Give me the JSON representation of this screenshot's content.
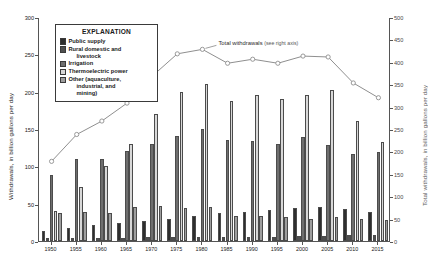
{
  "chart_data": {
    "type": "bar",
    "title": "",
    "subtitle": "",
    "xlabel": "",
    "ylabel": "Withdrawals, in billion gallons per day",
    "y2label": "Total withdrawals, in billion gallons per day",
    "ylim": [
      0,
      300
    ],
    "y2lim": [
      0,
      500
    ],
    "yticks": [
      0,
      50,
      100,
      150,
      200,
      250,
      300
    ],
    "y2ticks": [
      0,
      50,
      100,
      150,
      200,
      250,
      300,
      350,
      400,
      450,
      500
    ],
    "grid": false,
    "legend_position": "inside-top-left",
    "legend_title": "EXPLANATION",
    "categories": [
      "1950",
      "1955",
      "1960",
      "1965",
      "1970",
      "1975",
      "1980",
      "1985",
      "1990",
      "1995",
      "2000",
      "2005",
      "2010",
      "2015"
    ],
    "series": [
      {
        "name": "Public supply",
        "color": "#2e2e2e",
        "values": [
          14,
          17,
          21,
          24,
          27,
          29,
          34,
          37,
          39,
          41,
          44,
          45,
          43,
          39
        ]
      },
      {
        "name": "Rural domestic and livestock",
        "color": "#4f4f4f",
        "values": [
          4,
          4,
          4,
          4,
          5,
          5,
          6,
          6,
          6,
          6,
          7,
          7,
          8,
          8
        ]
      },
      {
        "name": "Irrigation",
        "color": "#6e6e6e",
        "values": [
          89,
          110,
          110,
          120,
          130,
          140,
          150,
          135,
          134,
          130,
          139,
          128,
          117,
          119
        ]
      },
      {
        "name": "Thermoelectric power",
        "color": "#d8d8d8",
        "values": [
          40,
          72,
          101,
          130,
          170,
          200,
          210,
          187,
          195,
          190,
          195,
          202,
          161,
          133
        ]
      },
      {
        "name": "Other (aquaculture, industrial, and mining)",
        "color": "#9e9e9e",
        "values": [
          37,
          39,
          38,
          46,
          47,
          44,
          45,
          33,
          33,
          32,
          30,
          32,
          30,
          28
        ]
      }
    ],
    "line_series": {
      "name": "Total withdrawals (see right axis)",
      "axis": "right",
      "color": "#8f8f8f",
      "marker": "open-circle",
      "values": [
        180,
        240,
        270,
        310,
        370,
        420,
        430,
        399,
        408,
        399,
        415,
        413,
        355,
        322
      ]
    },
    "annotation": {
      "main": "Total withdrawals",
      "sub": "(see right axis)"
    }
  },
  "legend": {
    "title": "EXPLANATION",
    "items": [
      {
        "label": "Public supply",
        "label2": "",
        "color": "#2e2e2e"
      },
      {
        "label": "Rural domestic and",
        "label2": "livestock",
        "color": "#4f4f4f"
      },
      {
        "label": "Irrigation",
        "label2": "",
        "color": "#6e6e6e"
      },
      {
        "label": "Thermoelectric power",
        "label2": "",
        "color": "#d8d8d8"
      },
      {
        "label": "Other (aquaculture,",
        "label2": "industrial, and",
        "label3": "mining)",
        "color": "#9e9e9e"
      }
    ]
  }
}
